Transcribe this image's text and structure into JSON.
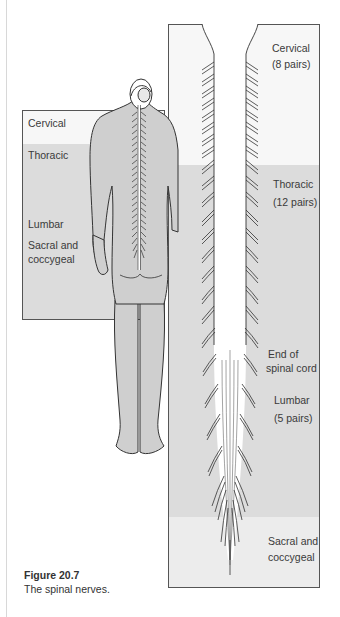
{
  "figure": {
    "number": "Figure 20.7",
    "caption": "The spinal nerves."
  },
  "inset": {
    "regions": [
      {
        "label": "Cervical"
      },
      {
        "label": "Thoracic"
      },
      {
        "label": "Lumbar"
      },
      {
        "label": "Sacral and"
      },
      {
        "label": "coccygeal"
      }
    ]
  },
  "panel": {
    "labels": [
      {
        "line1": "Cervical",
        "line2": "(8 pairs)"
      },
      {
        "line1": "Thoracic",
        "line2": "(12 pairs)"
      },
      {
        "line1": "End of",
        "line2": "spinal cord"
      },
      {
        "line1": "Lumbar",
        "line2": "(5 pairs)"
      },
      {
        "line1": "Sacral and",
        "line2": "coccygeal"
      }
    ]
  },
  "colors": {
    "band_white": "#f7f7f7",
    "band_grey": "#dcdcdc",
    "band_light": "#ececec",
    "body_fill": "#cfcfcf",
    "outline": "#333333"
  }
}
